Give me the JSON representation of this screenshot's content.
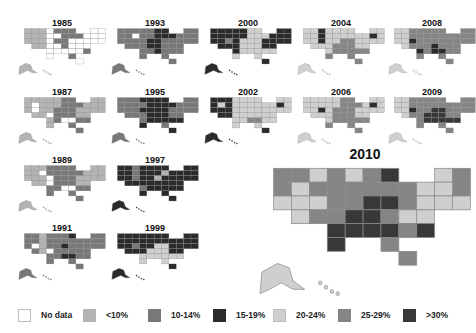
{
  "chart_data": {
    "type": "heatmap",
    "title": "",
    "subtitle": "",
    "legend": [
      {
        "label": "No data",
        "color": "#ffffff"
      },
      {
        "label": "<10%",
        "color": "#b3b3b3"
      },
      {
        "label": "10-14%",
        "color": "#787878"
      },
      {
        "label": "15-19%",
        "color": "#2b2b2b"
      },
      {
        "label": "20-24%",
        "color": "#cfcfcf"
      },
      {
        "label": "25-29%",
        "color": "#858585"
      },
      {
        "label": ">30%",
        "color": "#383838"
      }
    ],
    "panels": [
      {
        "year": "1985",
        "dominant": "No data"
      },
      {
        "year": "1987",
        "dominant": "<10%"
      },
      {
        "year": "1989",
        "dominant": "10-14%"
      },
      {
        "year": "1991",
        "dominant": "10-14%"
      },
      {
        "year": "1993",
        "dominant": "10-14%"
      },
      {
        "year": "1995",
        "dominant": "15-19%"
      },
      {
        "year": "1997",
        "dominant": "15-19%"
      },
      {
        "year": "1999",
        "dominant": "15-19%"
      },
      {
        "year": "2000",
        "dominant": "15-19%"
      },
      {
        "year": "2002",
        "dominant": "20-24%"
      },
      {
        "year": "2004",
        "dominant": "20-24%"
      },
      {
        "year": "2006",
        "dominant": "20-24%"
      },
      {
        "year": "2008",
        "dominant": "25-29%"
      },
      {
        "year": "2009",
        "dominant": "25-29%"
      },
      {
        "year": "2010",
        "dominant": "25-29%",
        "highlight": true
      }
    ],
    "legend_position": "bottom"
  },
  "labels": {
    "y1985": "1985",
    "y1987": "1987",
    "y1989": "1989",
    "y1991": "1991",
    "y1993": "1993",
    "y1995": "1995",
    "y1997": "1997",
    "y1999": "1999",
    "y2000": "2000",
    "y2002": "2002",
    "y2004": "2004",
    "y2006": "2006",
    "y2008": "2008",
    "y2009": "2009",
    "y2010": "2010"
  },
  "legend_labels": [
    "No data",
    "<10%",
    "10-14%",
    "15-19%",
    "20-24%",
    "25-29%",
    ">30%"
  ]
}
